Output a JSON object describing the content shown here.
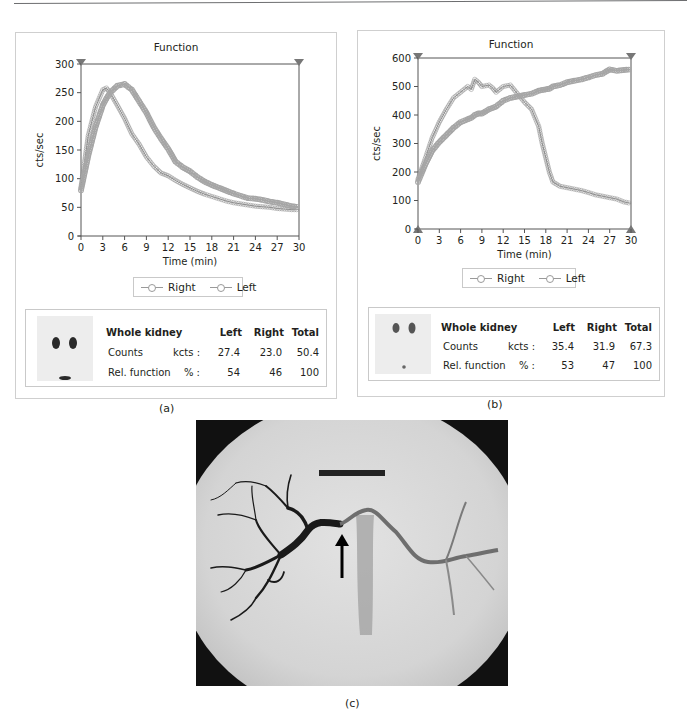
{
  "figure": {
    "captions": {
      "a": "(a)",
      "b": "(b)",
      "c": "(c)"
    }
  },
  "panel_a": {
    "title": "Function",
    "xlabel": "Time (min)",
    "ylabel": "cts/sec",
    "legend": [
      "Right",
      "Left"
    ],
    "summary": {
      "header": "Whole kidney",
      "columns": [
        "Left",
        "Right",
        "Total"
      ],
      "rows": [
        {
          "label": "Counts",
          "unit": "kcts :",
          "values": [
            "27.4",
            "23.0",
            "50.4"
          ]
        },
        {
          "label": "Rel. function",
          "unit": "% :",
          "values": [
            "54",
            "46",
            "100"
          ]
        }
      ]
    }
  },
  "panel_b": {
    "title": "Function",
    "xlabel": "Time (min)",
    "ylabel": "cts/sec",
    "legend": [
      "Right",
      "Left"
    ],
    "summary": {
      "header": "Whole kidney",
      "columns": [
        "Left",
        "Right",
        "Total"
      ],
      "rows": [
        {
          "label": "Counts",
          "unit": "kcts :",
          "values": [
            "35.4",
            "31.9",
            "67.3"
          ]
        },
        {
          "label": "Rel. function",
          "unit": "% :",
          "values": [
            "53",
            "47",
            "100"
          ]
        }
      ]
    }
  },
  "panel_c": {
    "description": "Renal angiogram with arrow indicating renal artery stenosis"
  },
  "chart_data": [
    {
      "type": "line",
      "title": "Function",
      "xlabel": "Time (min)",
      "ylabel": "cts/sec",
      "xlim": [
        0,
        30
      ],
      "ylim": [
        0,
        300
      ],
      "xticks": [
        0,
        3,
        6,
        9,
        12,
        15,
        18,
        21,
        24,
        27,
        30
      ],
      "yticks": [
        0,
        50,
        100,
        150,
        200,
        250,
        300
      ],
      "grid": false,
      "legend_position": "bottom",
      "x": [
        0,
        1,
        2,
        3,
        3.5,
        4,
        5,
        6,
        7,
        8,
        9,
        10,
        11,
        12,
        13,
        14,
        15,
        16,
        17,
        18,
        19,
        20,
        21,
        22,
        23,
        24,
        25,
        26,
        27,
        28,
        29,
        30
      ],
      "series": [
        {
          "name": "Right",
          "values": [
            85,
            175,
            225,
            255,
            258,
            250,
            228,
            205,
            178,
            160,
            138,
            122,
            110,
            105,
            97,
            90,
            84,
            78,
            73,
            69,
            65,
            61,
            58,
            56,
            54,
            52,
            51,
            50,
            48,
            47,
            46,
            46
          ]
        },
        {
          "name": "Left",
          "values": [
            80,
            140,
            190,
            228,
            240,
            250,
            262,
            265,
            255,
            235,
            215,
            190,
            170,
            152,
            130,
            120,
            113,
            103,
            95,
            89,
            84,
            79,
            74,
            70,
            66,
            65,
            63,
            60,
            58,
            55,
            52,
            50
          ]
        }
      ]
    },
    {
      "type": "line",
      "title": "Function",
      "xlabel": "Time (min)",
      "ylabel": "cts/sec",
      "xlim": [
        0,
        30
      ],
      "ylim": [
        0,
        600
      ],
      "xticks": [
        0,
        3,
        6,
        9,
        12,
        15,
        18,
        21,
        24,
        27,
        30
      ],
      "yticks": [
        0,
        100,
        200,
        300,
        400,
        500,
        600
      ],
      "grid": false,
      "legend_position": "bottom",
      "x": [
        0,
        1,
        2,
        3,
        4,
        5,
        6,
        7,
        7.5,
        8,
        8.5,
        9,
        10,
        10.5,
        11,
        12,
        13,
        14,
        15,
        16,
        17,
        17.5,
        18,
        18.5,
        19,
        20,
        21,
        22,
        23,
        24,
        25,
        26,
        27,
        28,
        29,
        30
      ],
      "series": [
        {
          "name": "Right",
          "values": [
            175,
            245,
            320,
            375,
            420,
            460,
            480,
            500,
            490,
            525,
            515,
            500,
            505,
            495,
            480,
            500,
            505,
            475,
            445,
            420,
            360,
            300,
            250,
            200,
            165,
            150,
            145,
            140,
            135,
            128,
            120,
            115,
            110,
            105,
            95,
            90
          ]
        },
        {
          "name": "Left",
          "values": [
            165,
            225,
            275,
            305,
            330,
            355,
            375,
            385,
            390,
            400,
            405,
            405,
            420,
            425,
            430,
            450,
            460,
            465,
            470,
            475,
            485,
            488,
            490,
            492,
            500,
            505,
            515,
            520,
            525,
            532,
            540,
            545,
            560,
            555,
            558,
            560
          ]
        }
      ]
    }
  ]
}
